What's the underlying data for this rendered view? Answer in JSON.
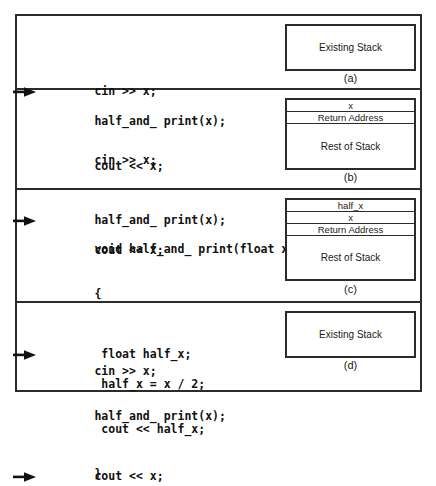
{
  "figure": {
    "panels": [
      {
        "caption": "(a)",
        "arrow_line_index": 0,
        "code": [
          "cin >> x;",
          "half_and_ print(x);",
          "cout << x;"
        ],
        "stack": {
          "kind": "existing",
          "label": "Existing Stack",
          "cells": []
        }
      },
      {
        "caption": "(b)",
        "arrow_line_index": 1,
        "code": [
          "cin >> x;",
          "half_and_ print(x);",
          "cout << x;"
        ],
        "stack": {
          "kind": "frames",
          "label": "",
          "cells": [
            "x",
            "Return Address",
            "Rest of Stack"
          ]
        }
      },
      {
        "caption": "(c)",
        "arrow_line_index": 2,
        "code": [
          "void half_and_ print(float x)",
          "{",
          " float half_x;",
          " half_x = x / 2;",
          " cout << half_x;",
          "}"
        ],
        "stack": {
          "kind": "frames",
          "label": "",
          "cells": [
            "half_x",
            "x",
            "Return Address",
            "Rest of Stack"
          ]
        }
      },
      {
        "caption": "(d)",
        "arrow_line_index": 2,
        "code": [
          "cin >> x;",
          "half_and_ print(x);",
          "cout << x;"
        ],
        "stack": {
          "kind": "existing",
          "label": "Existing Stack",
          "cells": []
        }
      }
    ]
  },
  "colors": {
    "ink": "#2b2b2b",
    "text": "#1a1a1a",
    "paper": "#ffffff"
  }
}
